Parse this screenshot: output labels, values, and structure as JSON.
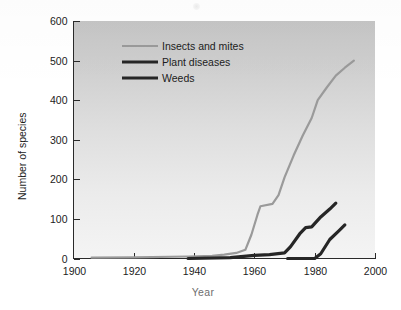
{
  "figure": {
    "name": "number-of-species-resistant-over-time",
    "background_color": "#ffffff",
    "plot_background_top": "#c6c6c6",
    "plot_background_bottom": "#f2f2f2"
  },
  "axes": {
    "x": {
      "title": "Year",
      "ticks": [
        "1900",
        "1920",
        "1940",
        "1960",
        "1980",
        "2000"
      ],
      "tick_values": [
        1900,
        1920,
        1940,
        1960,
        1980,
        2000
      ],
      "range": [
        1900,
        2000
      ]
    },
    "y": {
      "title": "Number of species",
      "ticks": [
        "0",
        "100",
        "200",
        "300",
        "400",
        "500",
        "600"
      ],
      "tick_values": [
        0,
        100,
        200,
        300,
        400,
        500,
        600
      ],
      "range": [
        0,
        600
      ]
    }
  },
  "legend": {
    "position": "top-left-inside",
    "items": [
      {
        "label": "Insects and mites",
        "color": "#9a9a9a",
        "width": 2.2
      },
      {
        "label": "Plant diseases",
        "color": "#262626",
        "width": 3.2
      },
      {
        "label": "Weeds",
        "color": "#262626",
        "width": 3.2
      }
    ]
  },
  "chart_data": {
    "type": "line",
    "title": "",
    "subtitle": "",
    "xlabel": "Year",
    "ylabel": "Number of species",
    "xlim": [
      1900,
      2000
    ],
    "ylim": [
      0,
      600
    ],
    "grid": false,
    "legend_position": "top-left-inside",
    "series": [
      {
        "name": "Insects and mites",
        "color": "#9a9a9a",
        "points": [
          [
            1906,
            2
          ],
          [
            1920,
            3
          ],
          [
            1938,
            5
          ],
          [
            1946,
            7
          ],
          [
            1950,
            10
          ],
          [
            1954,
            14
          ],
          [
            1957,
            22
          ],
          [
            1959,
            60
          ],
          [
            1961,
            110
          ],
          [
            1962,
            132
          ],
          [
            1966,
            138
          ],
          [
            1968,
            160
          ],
          [
            1970,
            205
          ],
          [
            1973,
            260
          ],
          [
            1976,
            310
          ],
          [
            1979,
            355
          ],
          [
            1981,
            400
          ],
          [
            1984,
            432
          ],
          [
            1987,
            462
          ],
          [
            1990,
            482
          ],
          [
            1993,
            500
          ]
        ]
      },
      {
        "name": "Plant diseases",
        "color": "#262626",
        "points": [
          [
            1938,
            0
          ],
          [
            1952,
            2
          ],
          [
            1960,
            8
          ],
          [
            1965,
            10
          ],
          [
            1970,
            14
          ],
          [
            1972,
            30
          ],
          [
            1975,
            62
          ],
          [
            1977,
            78
          ],
          [
            1979,
            80
          ],
          [
            1982,
            105
          ],
          [
            1985,
            125
          ],
          [
            1987,
            140
          ]
        ]
      },
      {
        "name": "Weeds",
        "color": "#262626",
        "points": [
          [
            1971,
            0
          ],
          [
            1980,
            0
          ],
          [
            1982,
            12
          ],
          [
            1985,
            48
          ],
          [
            1988,
            70
          ],
          [
            1990,
            85
          ]
        ]
      }
    ]
  }
}
